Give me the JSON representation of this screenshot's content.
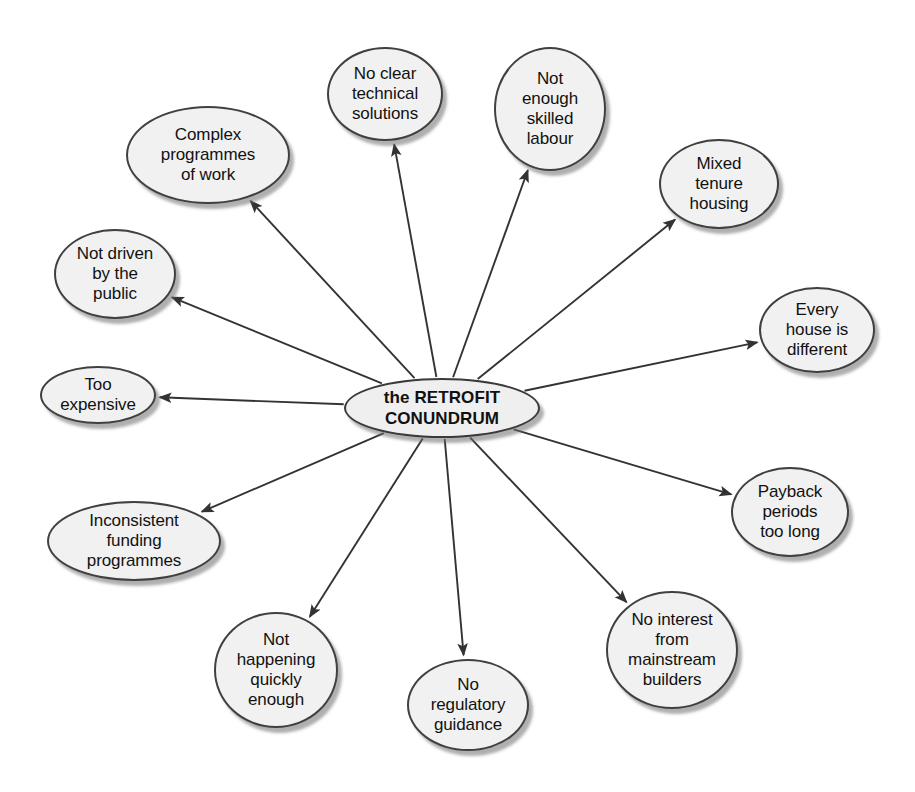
{
  "diagram": {
    "center": {
      "label": "the RETROFIT CONUNDRUM",
      "x": 442,
      "y": 408,
      "w": 196,
      "h": 60
    },
    "colors": {
      "node_fill": "#f1f1f1",
      "node_stroke": "#404040",
      "arrow": "#333333",
      "text": "#111111",
      "background": "#ffffff"
    },
    "nodes": [
      {
        "id": "complex-programmes-of-work",
        "label": "Complex\nprogrammes\nof work",
        "x": 208,
        "y": 155,
        "w": 164,
        "h": 98
      },
      {
        "id": "no-clear-technical-solutions",
        "label": "No clear\ntechnical\nsolutions",
        "x": 385,
        "y": 94,
        "w": 116,
        "h": 94
      },
      {
        "id": "not-enough-skilled-labour",
        "label": "Not\nenough\nskilled\nlabour",
        "x": 550,
        "y": 109,
        "w": 112,
        "h": 124
      },
      {
        "id": "mixed-tenure-housing",
        "label": "Mixed\ntenure\nhousing",
        "x": 719,
        "y": 184,
        "w": 120,
        "h": 90
      },
      {
        "id": "every-house-is-different",
        "label": "Every\nhouse is\ndifferent",
        "x": 817,
        "y": 330,
        "w": 116,
        "h": 86
      },
      {
        "id": "payback-periods-too-long",
        "label": "Payback\nperiods\ntoo long",
        "x": 790,
        "y": 512,
        "w": 118,
        "h": 90
      },
      {
        "id": "no-interest-from-mainstream-builders",
        "label": "No interest\nfrom\nmainstream\nbuilders",
        "x": 672,
        "y": 650,
        "w": 132,
        "h": 118
      },
      {
        "id": "no-regulatory-guidance",
        "label": "No\nregulatory\nguidance",
        "x": 468,
        "y": 705,
        "w": 122,
        "h": 92
      },
      {
        "id": "not-happening-quickly-enough",
        "label": "Not\nhappening\nquickly\nenough",
        "x": 276,
        "y": 670,
        "w": 124,
        "h": 116
      },
      {
        "id": "inconsistent-funding-programmes",
        "label": "Inconsistent\nfunding\nprogrammes",
        "x": 134,
        "y": 541,
        "w": 174,
        "h": 80
      },
      {
        "id": "too-expensive",
        "label": "Too\nexpensive",
        "x": 98,
        "y": 395,
        "w": 116,
        "h": 58
      },
      {
        "id": "not-driven-by-the-public",
        "label": "Not driven\nby the\npublic",
        "x": 115,
        "y": 274,
        "w": 122,
        "h": 90
      }
    ],
    "edges": [
      {
        "from": "center",
        "to": "complex-programmes-of-work"
      },
      {
        "from": "center",
        "to": "no-clear-technical-solutions"
      },
      {
        "from": "center",
        "to": "not-enough-skilled-labour"
      },
      {
        "from": "center",
        "to": "mixed-tenure-housing"
      },
      {
        "from": "center",
        "to": "every-house-is-different"
      },
      {
        "from": "center",
        "to": "payback-periods-too-long"
      },
      {
        "from": "center",
        "to": "no-interest-from-mainstream-builders"
      },
      {
        "from": "center",
        "to": "no-regulatory-guidance"
      },
      {
        "from": "center",
        "to": "not-happening-quickly-enough"
      },
      {
        "from": "center",
        "to": "inconsistent-funding-programmes"
      },
      {
        "from": "center",
        "to": "too-expensive"
      },
      {
        "from": "center",
        "to": "not-driven-by-the-public"
      }
    ]
  }
}
